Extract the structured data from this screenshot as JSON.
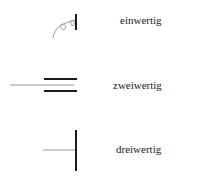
{
  "diagram": {
    "items": [
      {
        "label": "einwertig",
        "symbol": "coil-spring-support-icon"
      },
      {
        "label": "zweiwertig",
        "symbol": "double-bar-support-icon"
      },
      {
        "label": "dreiwertig",
        "symbol": "fixed-bar-support-icon"
      }
    ],
    "colors": {
      "thick_line": "#1a1a1a",
      "thin_line": "#999999",
      "text": "#222222"
    }
  }
}
